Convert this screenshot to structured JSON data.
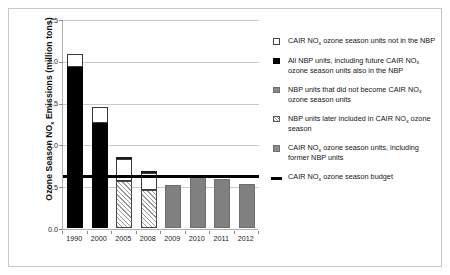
{
  "chart_data": {
    "type": "bar",
    "title": "",
    "xlabel": "",
    "ylabel": "Ozone Season NOₓ Emissions (million tons)",
    "ylabel_parts": {
      "pre": "Ozone Season NO",
      "sub": "x",
      "post": " Emissions (million tons)"
    },
    "categories": [
      "1990",
      "2000",
      "2005",
      "2008",
      "2009",
      "2010",
      "2011",
      "2012"
    ],
    "ylim": [
      0.0,
      2.5
    ],
    "ytick_labels": [
      "0.0",
      "0.5",
      "1.0",
      "1.5",
      "2.0",
      "2.5"
    ],
    "ytick_values": [
      0.0,
      0.5,
      1.0,
      1.5,
      2.0,
      2.5
    ],
    "grid": true,
    "legend_position": "right",
    "stacked": true,
    "series": [
      {
        "name": "All NBP units, including future CAIR NOx ozone season units also in the NBP",
        "key": "nbp_all",
        "color": "#000000",
        "style": "solid-black",
        "values": [
          1.93,
          1.26,
          0,
          0,
          0,
          0,
          0,
          0
        ]
      },
      {
        "name": "NBP units later included in CAIR NOx ozone season",
        "key": "nbp_later_cair",
        "color": "#ffffff",
        "style": "hatched",
        "values": [
          0,
          0,
          0.56,
          0.45,
          0,
          0,
          0,
          0
        ]
      },
      {
        "name": "CAIR NOx ozone season units, including former NBP units",
        "key": "cair_incl_nbp",
        "color": "#808080",
        "style": "solid-gray",
        "values": [
          0,
          0,
          0,
          0,
          0.52,
          0.62,
          0.59,
          0.53
        ]
      },
      {
        "name": "CAIR NOx ozone season units not in the NBP",
        "key": "cair_not_nbp",
        "color": "#ffffff",
        "style": "open-white",
        "values": [
          0.15,
          0.19,
          0.26,
          0.21,
          0,
          0,
          0,
          0
        ]
      },
      {
        "name": "NBP units that did not become CAIR NOx ozone season units",
        "key": "nbp_not_cair",
        "color": "#2b2b2b",
        "style": "solid-darkgray",
        "values": [
          0,
          0,
          0.02,
          0.01,
          0,
          0,
          0,
          0
        ]
      }
    ],
    "totals": [
      2.08,
      1.45,
      0.84,
      0.67,
      0.52,
      0.62,
      0.59,
      0.53
    ],
    "reference_line": {
      "label": "CAIR NOx ozone season budget",
      "value": 0.63,
      "color": "#000000"
    }
  },
  "legend": {
    "items": [
      {
        "swatch": "white",
        "text_parts": [
          {
            "t": "CAIR NO"
          },
          {
            "sub": "x"
          },
          {
            "t": " ozone season units not in the NBP"
          }
        ]
      },
      {
        "swatch": "black",
        "text_parts": [
          {
            "t": "All NBP units, including future CAIR NO"
          },
          {
            "sub": "x"
          },
          {
            "t": " ozone season units also in the NBP"
          }
        ]
      },
      {
        "swatch": "gray",
        "text_parts": [
          {
            "t": "NBP units that did not become CAIR NO"
          },
          {
            "sub": "x"
          },
          {
            "t": " ozone season units"
          }
        ]
      },
      {
        "swatch": "hatch",
        "text_parts": [
          {
            "t": "NBP units later included in CAIR NO"
          },
          {
            "sub": "x"
          },
          {
            "t": " ozone season"
          }
        ]
      },
      {
        "swatch": "gray",
        "text_parts": [
          {
            "t": "CAIR NO"
          },
          {
            "sub": "x"
          },
          {
            "t": " ozone season units, including former NBP units"
          }
        ]
      },
      {
        "swatch": "grayline",
        "text_parts": [
          {
            "t": "CAIR NO"
          },
          {
            "sub": "x"
          },
          {
            "t": " ozone season budget"
          }
        ]
      }
    ]
  }
}
